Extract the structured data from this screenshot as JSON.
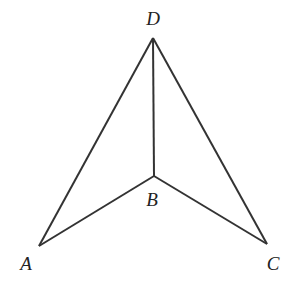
{
  "diagram": {
    "type": "geometry",
    "points": {
      "A": {
        "label": "A",
        "x": 39,
        "y": 246,
        "lx": 26,
        "ly": 270
      },
      "B": {
        "label": "B",
        "x": 154,
        "y": 176,
        "lx": 152,
        "ly": 206
      },
      "C": {
        "label": "C",
        "x": 267,
        "y": 244,
        "lx": 273,
        "ly": 270
      },
      "D": {
        "label": "D",
        "x": 153,
        "y": 38,
        "lx": 153,
        "ly": 25
      }
    },
    "segments": [
      [
        "D",
        "A"
      ],
      [
        "D",
        "B"
      ],
      [
        "D",
        "C"
      ],
      [
        "A",
        "B"
      ],
      [
        "B",
        "C"
      ]
    ],
    "stroke_color": "#333333"
  }
}
